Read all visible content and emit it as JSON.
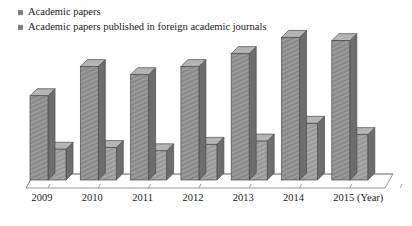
{
  "chart_data": {
    "type": "bar",
    "title": "",
    "subtitle": "",
    "xlabel": "(Year)",
    "ylabel": "",
    "categories": [
      "2009",
      "2010",
      "2011",
      "2012",
      "2013",
      "2014",
      "2015"
    ],
    "series": [
      {
        "name": "Academic papers",
        "color": "#8a8a8a",
        "values": [
          52,
          70,
          65,
          70,
          78,
          88,
          86
        ]
      },
      {
        "name": "Academic papers published in foreign academic journals",
        "color": "#9a9a9a",
        "values": [
          19,
          20,
          18,
          22,
          24,
          35,
          28
        ]
      }
    ],
    "ylim": [
      0,
      100
    ],
    "grid": false,
    "legend_position": "top-left",
    "style": "3d-grouped-bar",
    "annotations": []
  },
  "legend": {
    "items": [
      {
        "label": "Academic papers",
        "marker": "square-swatch"
      },
      {
        "label": "Academic papers published in foreign academic journals",
        "marker": "square-swatch"
      }
    ]
  },
  "axis": {
    "unit_label": "(Year)",
    "tick_labels": [
      "2009",
      "2010",
      "2011",
      "2012",
      "2013",
      "2014",
      "2015"
    ]
  },
  "colors": {
    "bar_front": "#8a8a8a",
    "bar_front_alt": "#9a9a9a",
    "bar_side": "#6d6d6d",
    "bar_top": "#b4b4b4",
    "bar_outline": "#4a4a4a",
    "floor": "#fdfdfd",
    "floor_line": "#8d8d8d",
    "text": "#1a1a1a"
  }
}
